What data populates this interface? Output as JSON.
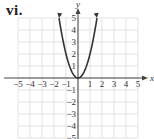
{
  "problem_label": "vi.",
  "chart_data": {
    "type": "line",
    "title": "",
    "xlabel": "x",
    "ylabel": "y",
    "xlim": [
      -5,
      5
    ],
    "ylim": [
      -5,
      5
    ],
    "grid": true,
    "x_ticks": [
      "-5",
      "-4",
      "-3",
      "-2",
      "-1",
      "1",
      "2",
      "3",
      "4",
      "5"
    ],
    "y_ticks": [
      "5",
      "4",
      "3",
      "2",
      "1",
      "-1",
      "-2",
      "-3",
      "-4",
      "-5"
    ],
    "series": [
      {
        "name": "parabola",
        "equation": "y = 2x^2",
        "x": [
          -1.58,
          -1.5,
          -1,
          -0.5,
          0,
          0.5,
          1,
          1.5,
          1.58
        ],
        "y": [
          5,
          4.5,
          2,
          0.5,
          0,
          0.5,
          2,
          4.5,
          5
        ],
        "arrows_at_ends": true
      }
    ]
  }
}
